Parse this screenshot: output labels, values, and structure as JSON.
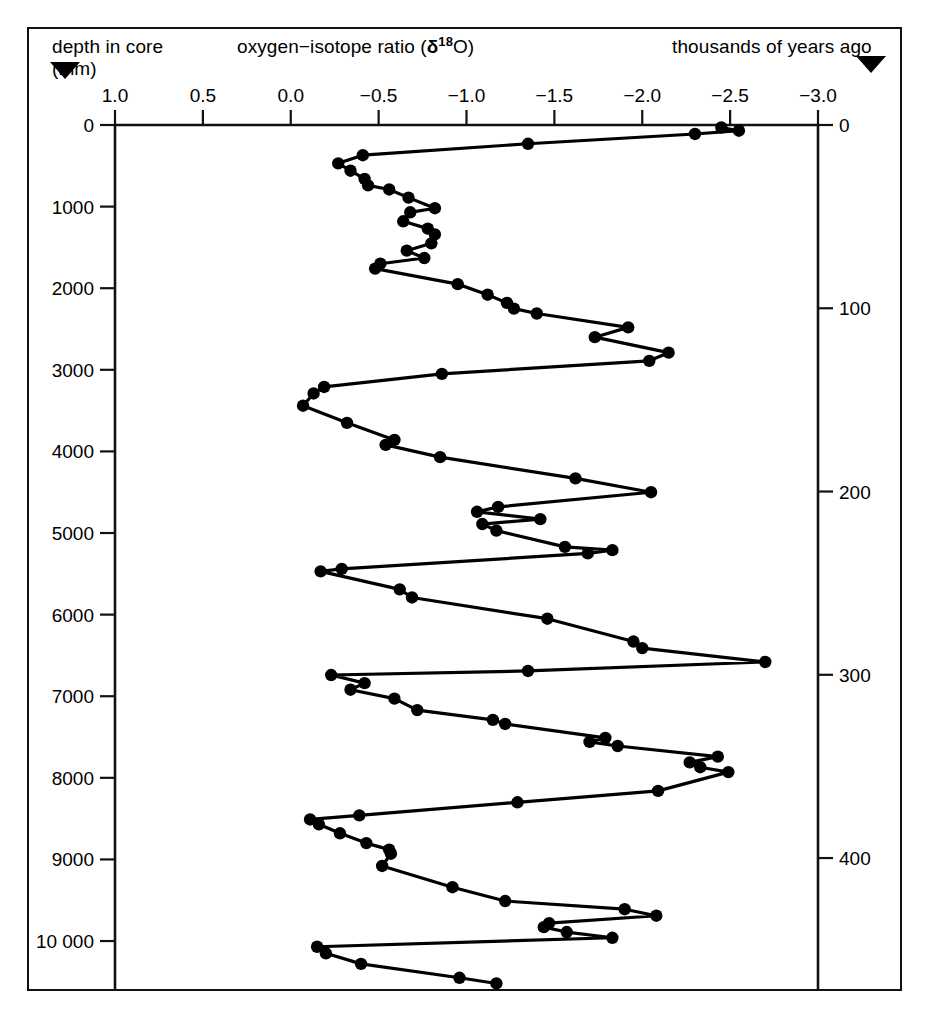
{
  "figure": {
    "header": {
      "depth_label": "depth in core",
      "depth_unit": "(mm)",
      "ratio_label_prefix": "oxygen−isotope ratio (",
      "ratio_delta": "δ",
      "ratio_superscript": "18",
      "ratio_label_suffix": "O)",
      "years_label": "thousands of years ago"
    },
    "markers": {
      "left_triangle": "triangle-down-marker",
      "right_triangle": "triangle-down-marker"
    }
  },
  "chart_data": {
    "type": "line",
    "title": "",
    "subtitle": "",
    "orientation": "vertical",
    "xlabel": "oxygen−isotope ratio (δ18O)",
    "ylabel": "depth in core (mm)",
    "y2label": "thousands of years ago",
    "grid": false,
    "legend": null,
    "xlim": [
      1.0,
      -3.0
    ],
    "xticks": [
      1.0,
      0.5,
      0.0,
      -0.5,
      -1.0,
      -1.5,
      -2.0,
      -2.5,
      -3.0
    ],
    "xticklabels": [
      "1.0",
      "0.5",
      "0.0",
      "−0.5",
      "−1.0",
      "−1.5",
      "−2.0",
      "−2.5",
      "−3.0"
    ],
    "ylim": [
      0,
      10600
    ],
    "yticks": [
      0,
      1000,
      2000,
      3000,
      4000,
      5000,
      6000,
      7000,
      8000,
      9000,
      10000
    ],
    "yticklabels": [
      "0",
      "1000",
      "2000",
      "3000",
      "4000",
      "5000",
      "6000",
      "7000",
      "8000",
      "9000",
      "10 000"
    ],
    "y2lim": [
      0,
      472
    ],
    "y2ticks": [
      0,
      100,
      200,
      300,
      400
    ],
    "y2ticklabels": [
      "0",
      "100",
      "200",
      "300",
      "400"
    ],
    "series": [
      {
        "name": "oxygen-isotope ratio vs depth",
        "marker": "filled-circle",
        "color": "#000000",
        "points": [
          {
            "depth_mm": 30,
            "ratio": -2.45
          },
          {
            "depth_mm": 70,
            "ratio": -2.55
          },
          {
            "depth_mm": 110,
            "ratio": -2.3
          },
          {
            "depth_mm": 230,
            "ratio": -1.35
          },
          {
            "depth_mm": 370,
            "ratio": -0.41
          },
          {
            "depth_mm": 470,
            "ratio": -0.27
          },
          {
            "depth_mm": 560,
            "ratio": -0.34
          },
          {
            "depth_mm": 660,
            "ratio": -0.42
          },
          {
            "depth_mm": 740,
            "ratio": -0.44
          },
          {
            "depth_mm": 790,
            "ratio": -0.56
          },
          {
            "depth_mm": 890,
            "ratio": -0.67
          },
          {
            "depth_mm": 1020,
            "ratio": -0.82
          },
          {
            "depth_mm": 1070,
            "ratio": -0.68
          },
          {
            "depth_mm": 1180,
            "ratio": -0.64
          },
          {
            "depth_mm": 1270,
            "ratio": -0.78
          },
          {
            "depth_mm": 1340,
            "ratio": -0.82
          },
          {
            "depth_mm": 1450,
            "ratio": -0.8
          },
          {
            "depth_mm": 1540,
            "ratio": -0.66
          },
          {
            "depth_mm": 1630,
            "ratio": -0.76
          },
          {
            "depth_mm": 1700,
            "ratio": -0.51
          },
          {
            "depth_mm": 1760,
            "ratio": -0.48
          },
          {
            "depth_mm": 1950,
            "ratio": -0.95
          },
          {
            "depth_mm": 2080,
            "ratio": -1.12
          },
          {
            "depth_mm": 2180,
            "ratio": -1.23
          },
          {
            "depth_mm": 2250,
            "ratio": -1.27
          },
          {
            "depth_mm": 2310,
            "ratio": -1.4
          },
          {
            "depth_mm": 2480,
            "ratio": -1.92
          },
          {
            "depth_mm": 2600,
            "ratio": -1.73
          },
          {
            "depth_mm": 2790,
            "ratio": -2.15
          },
          {
            "depth_mm": 2890,
            "ratio": -2.04
          },
          {
            "depth_mm": 3050,
            "ratio": -0.86
          },
          {
            "depth_mm": 3210,
            "ratio": -0.19
          },
          {
            "depth_mm": 3290,
            "ratio": -0.13
          },
          {
            "depth_mm": 3440,
            "ratio": -0.07
          },
          {
            "depth_mm": 3650,
            "ratio": -0.32
          },
          {
            "depth_mm": 3860,
            "ratio": -0.59
          },
          {
            "depth_mm": 3920,
            "ratio": -0.54
          },
          {
            "depth_mm": 4070,
            "ratio": -0.85
          },
          {
            "depth_mm": 4330,
            "ratio": -1.62
          },
          {
            "depth_mm": 4500,
            "ratio": -2.05
          },
          {
            "depth_mm": 4680,
            "ratio": -1.18
          },
          {
            "depth_mm": 4740,
            "ratio": -1.06
          },
          {
            "depth_mm": 4830,
            "ratio": -1.42
          },
          {
            "depth_mm": 4890,
            "ratio": -1.09
          },
          {
            "depth_mm": 4970,
            "ratio": -1.17
          },
          {
            "depth_mm": 5170,
            "ratio": -1.56
          },
          {
            "depth_mm": 5210,
            "ratio": -1.83
          },
          {
            "depth_mm": 5250,
            "ratio": -1.69
          },
          {
            "depth_mm": 5440,
            "ratio": -0.29
          },
          {
            "depth_mm": 5470,
            "ratio": -0.17
          },
          {
            "depth_mm": 5690,
            "ratio": -0.62
          },
          {
            "depth_mm": 5790,
            "ratio": -0.69
          },
          {
            "depth_mm": 6050,
            "ratio": -1.46
          },
          {
            "depth_mm": 6330,
            "ratio": -1.95
          },
          {
            "depth_mm": 6410,
            "ratio": -2.0
          },
          {
            "depth_mm": 6580,
            "ratio": -2.7
          },
          {
            "depth_mm": 6690,
            "ratio": -1.35
          },
          {
            "depth_mm": 6740,
            "ratio": -0.23
          },
          {
            "depth_mm": 6840,
            "ratio": -0.42
          },
          {
            "depth_mm": 6920,
            "ratio": -0.34
          },
          {
            "depth_mm": 7030,
            "ratio": -0.59
          },
          {
            "depth_mm": 7170,
            "ratio": -0.72
          },
          {
            "depth_mm": 7290,
            "ratio": -1.15
          },
          {
            "depth_mm": 7340,
            "ratio": -1.22
          },
          {
            "depth_mm": 7510,
            "ratio": -1.79
          },
          {
            "depth_mm": 7560,
            "ratio": -1.7
          },
          {
            "depth_mm": 7610,
            "ratio": -1.86
          },
          {
            "depth_mm": 7740,
            "ratio": -2.43
          },
          {
            "depth_mm": 7810,
            "ratio": -2.27
          },
          {
            "depth_mm": 7870,
            "ratio": -2.33
          },
          {
            "depth_mm": 7930,
            "ratio": -2.49
          },
          {
            "depth_mm": 8160,
            "ratio": -2.09
          },
          {
            "depth_mm": 8300,
            "ratio": -1.29
          },
          {
            "depth_mm": 8460,
            "ratio": -0.39
          },
          {
            "depth_mm": 8510,
            "ratio": -0.11
          },
          {
            "depth_mm": 8570,
            "ratio": -0.16
          },
          {
            "depth_mm": 8680,
            "ratio": -0.28
          },
          {
            "depth_mm": 8800,
            "ratio": -0.43
          },
          {
            "depth_mm": 8880,
            "ratio": -0.56
          },
          {
            "depth_mm": 8930,
            "ratio": -0.57
          },
          {
            "depth_mm": 9080,
            "ratio": -0.52
          },
          {
            "depth_mm": 9340,
            "ratio": -0.92
          },
          {
            "depth_mm": 9510,
            "ratio": -1.22
          },
          {
            "depth_mm": 9610,
            "ratio": -1.9
          },
          {
            "depth_mm": 9690,
            "ratio": -2.08
          },
          {
            "depth_mm": 9780,
            "ratio": -1.47
          },
          {
            "depth_mm": 9830,
            "ratio": -1.44
          },
          {
            "depth_mm": 9890,
            "ratio": -1.57
          },
          {
            "depth_mm": 9960,
            "ratio": -1.83
          },
          {
            "depth_mm": 10070,
            "ratio": -0.15
          },
          {
            "depth_mm": 10150,
            "ratio": -0.2
          },
          {
            "depth_mm": 10280,
            "ratio": -0.4
          },
          {
            "depth_mm": 10450,
            "ratio": -0.96
          },
          {
            "depth_mm": 10520,
            "ratio": -1.17
          }
        ]
      }
    ]
  }
}
